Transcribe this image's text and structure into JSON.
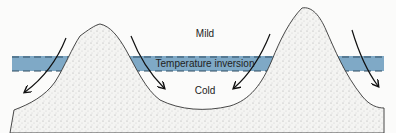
{
  "diagram": {
    "labels": {
      "upper": "Mild",
      "band": "Temperature inversion",
      "lower": "Cold"
    },
    "colors": {
      "inversion_band": "#7fa9c6",
      "background": "#fbfbfa",
      "outline": "#333333"
    },
    "arrows": [
      {
        "side": "left-mountain-west"
      },
      {
        "side": "left-mountain-east"
      },
      {
        "side": "right-mountain-west"
      },
      {
        "side": "right-mountain-east"
      }
    ]
  }
}
